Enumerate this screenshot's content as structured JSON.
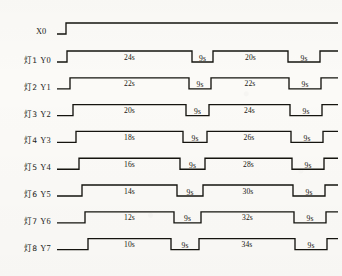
{
  "input": {
    "label": "X0",
    "kind": "step",
    "note": "low then high"
  },
  "units": "s",
  "gap_label": "9s",
  "rows": [
    {
      "lamp": "灯1",
      "signal": "Y0",
      "segments": [
        "24s",
        "9s",
        "20s",
        "9s"
      ]
    },
    {
      "lamp": "灯2",
      "signal": "Y1",
      "segments": [
        "22s",
        "9s",
        "22s",
        "9s"
      ]
    },
    {
      "lamp": "灯3",
      "signal": "Y2",
      "segments": [
        "20s",
        "9s",
        "24s",
        "9s"
      ]
    },
    {
      "lamp": "灯4",
      "signal": "Y3",
      "segments": [
        "18s",
        "9s",
        "26s",
        "9s"
      ]
    },
    {
      "lamp": "灯5",
      "signal": "Y4",
      "segments": [
        "16s",
        "9s",
        "28s",
        "9s"
      ]
    },
    {
      "lamp": "灯6",
      "signal": "Y5",
      "segments": [
        "14s",
        "9s",
        "30s",
        "9s"
      ]
    },
    {
      "lamp": "灯7",
      "signal": "Y6",
      "segments": [
        "12s",
        "9s",
        "32s",
        "9s"
      ]
    },
    {
      "lamp": "灯8",
      "signal": "Y7",
      "segments": [
        "10s",
        "9s",
        "34s",
        "9s"
      ]
    }
  ],
  "colors": {
    "line": "#15140f",
    "paper": "#fbfaf7",
    "text": "#1a1a18"
  },
  "chart_data": {
    "type": "line",
    "xlabel": "",
    "ylabel": "",
    "grid": false,
    "legend": "none",
    "signals": [
      {
        "name": "X0",
        "row_label": "",
        "type": "step",
        "transitions": [
          {
            "x": 66,
            "level": 1
          }
        ],
        "initial_level": 0,
        "durations": []
      },
      {
        "name": "Y0",
        "row_label": "灯1",
        "type": "pulse",
        "initial_level": 0,
        "durations": [
          24,
          9,
          20,
          9
        ],
        "transitions": [
          {
            "x": 67,
            "level": 1
          },
          {
            "x": 192,
            "level": 0
          },
          {
            "x": 213,
            "level": 1
          },
          {
            "x": 288,
            "level": 0
          },
          {
            "x": 320,
            "level": 1
          }
        ]
      },
      {
        "name": "Y1",
        "row_label": "灯2",
        "type": "pulse",
        "initial_level": 0,
        "durations": [
          22,
          9,
          22,
          9
        ],
        "transitions": [
          {
            "x": 70,
            "level": 1
          },
          {
            "x": 189,
            "level": 0
          },
          {
            "x": 211,
            "level": 1
          },
          {
            "x": 289,
            "level": 0
          },
          {
            "x": 321,
            "level": 1
          }
        ]
      },
      {
        "name": "Y2",
        "row_label": "灯3",
        "type": "pulse",
        "initial_level": 0,
        "durations": [
          20,
          9,
          24,
          9
        ],
        "transitions": [
          {
            "x": 73,
            "level": 1
          },
          {
            "x": 186,
            "level": 0
          },
          {
            "x": 209,
            "level": 1
          },
          {
            "x": 290,
            "level": 0
          },
          {
            "x": 322,
            "level": 1
          }
        ]
      },
      {
        "name": "Y3",
        "row_label": "灯4",
        "type": "pulse",
        "initial_level": 0,
        "durations": [
          18,
          9,
          26,
          9
        ],
        "transitions": [
          {
            "x": 76,
            "level": 1
          },
          {
            "x": 183,
            "level": 0
          },
          {
            "x": 207,
            "level": 1
          },
          {
            "x": 291,
            "level": 0
          },
          {
            "x": 323,
            "level": 1
          }
        ]
      },
      {
        "name": "Y4",
        "row_label": "灯5",
        "type": "pulse",
        "initial_level": 0,
        "durations": [
          16,
          9,
          28,
          9
        ],
        "transitions": [
          {
            "x": 79,
            "level": 1
          },
          {
            "x": 180,
            "level": 0
          },
          {
            "x": 205,
            "level": 1
          },
          {
            "x": 292,
            "level": 0
          },
          {
            "x": 324,
            "level": 1
          }
        ]
      },
      {
        "name": "Y5",
        "row_label": "灯6",
        "type": "pulse",
        "initial_level": 0,
        "durations": [
          14,
          9,
          30,
          9
        ],
        "transitions": [
          {
            "x": 82,
            "level": 1
          },
          {
            "x": 177,
            "level": 0
          },
          {
            "x": 203,
            "level": 1
          },
          {
            "x": 293,
            "level": 0
          },
          {
            "x": 325,
            "level": 1
          }
        ]
      },
      {
        "name": "Y6",
        "row_label": "灯7",
        "type": "pulse",
        "initial_level": 0,
        "durations": [
          12,
          9,
          32,
          9
        ],
        "transitions": [
          {
            "x": 85,
            "level": 1
          },
          {
            "x": 174,
            "level": 0
          },
          {
            "x": 201,
            "level": 1
          },
          {
            "x": 294,
            "level": 0
          },
          {
            "x": 326,
            "level": 1
          }
        ]
      },
      {
        "name": "Y7",
        "row_label": "灯8",
        "type": "pulse",
        "initial_level": 0,
        "durations": [
          10,
          9,
          34,
          9
        ],
        "transitions": [
          {
            "x": 88,
            "level": 1
          },
          {
            "x": 171,
            "level": 0
          },
          {
            "x": 199,
            "level": 1
          },
          {
            "x": 295,
            "level": 0
          },
          {
            "x": 327,
            "level": 1
          }
        ]
      }
    ]
  }
}
